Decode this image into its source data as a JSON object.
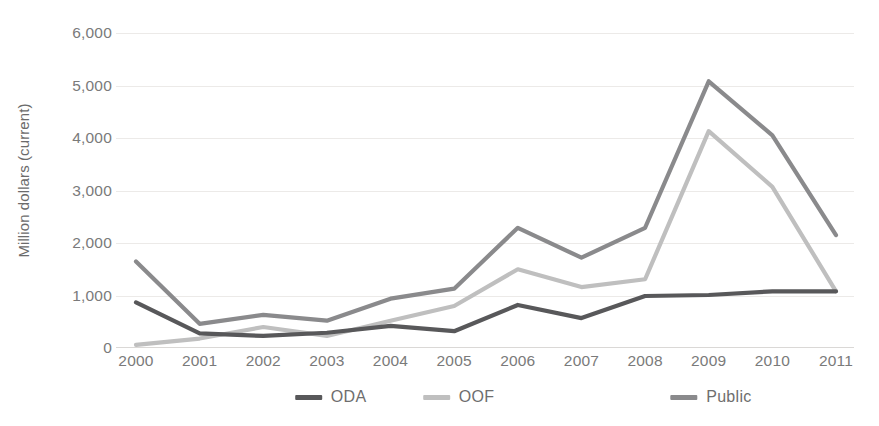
{
  "chart_data": {
    "type": "line",
    "title": "",
    "xlabel": "",
    "ylabel": "Million dollars (current)",
    "categories": [
      "2000",
      "2001",
      "2002",
      "2003",
      "2004",
      "2005",
      "2006",
      "2007",
      "2008",
      "2009",
      "2010",
      "2011"
    ],
    "x": [
      2000,
      2001,
      2002,
      2003,
      2004,
      2005,
      2006,
      2007,
      2008,
      2009,
      2010,
      2011
    ],
    "ylim": [
      0,
      6000
    ],
    "yticks": [
      0,
      1000,
      2000,
      3000,
      4000,
      5000,
      6000
    ],
    "ytick_labels": [
      "0",
      "1,000",
      "2,000",
      "3,000",
      "4,000",
      "5,000",
      "6,000"
    ],
    "grid": true,
    "grid_axis": "y",
    "legend_position": "bottom",
    "series": [
      {
        "name": "ODA",
        "color": "#58585a",
        "values": [
          870,
          280,
          230,
          290,
          420,
          320,
          820,
          570,
          990,
          1010,
          1080,
          1080
        ]
      },
      {
        "name": "OOF",
        "color": "#bfbfbf",
        "values": [
          60,
          180,
          400,
          230,
          520,
          800,
          1500,
          1160,
          1310,
          4130,
          3070,
          1080
        ]
      },
      {
        "name": "Public",
        "color": "#8a8a8c",
        "values": [
          1650,
          460,
          630,
          520,
          940,
          1130,
          2290,
          1720,
          2290,
          5080,
          4050,
          2150
        ]
      }
    ]
  },
  "legend": {
    "items": [
      {
        "label": "ODA",
        "swatch_name": "legend-swatch-oda"
      },
      {
        "label": "OOF",
        "swatch_name": "legend-swatch-oof"
      },
      {
        "label": "Public",
        "swatch_name": "legend-swatch-public"
      }
    ]
  }
}
